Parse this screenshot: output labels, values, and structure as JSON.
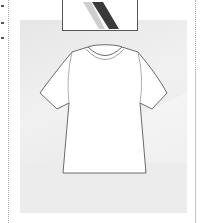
{
  "page": {
    "left_markers": [
      5,
      22,
      37
    ]
  },
  "product_card": {
    "image": {
      "subject": "tshirt-outline",
      "background_color": "#e8e8e8",
      "outline_color": "#6a6a6a",
      "fill_color": "#ffffff"
    },
    "previous_item": {
      "subject": "striped-item-cropped",
      "stripe_color": "#3a3a3a"
    }
  }
}
